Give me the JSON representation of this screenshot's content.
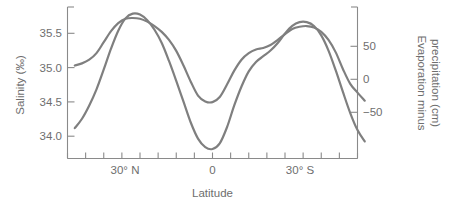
{
  "chart_data": {
    "type": "line",
    "title": "",
    "xlabel": "Latitude",
    "ylabel": "Salinity (‰)",
    "y2label": "Evaporation minus precipitation (cm)",
    "xlim": [
      40,
      -40
    ],
    "ylim": [
      33.78,
      35.85
    ],
    "y2lim": [
      -78,
      82
    ],
    "grid": false,
    "legend": "none",
    "x_tick_labels": [
      "30° N",
      "0",
      "30° S"
    ],
    "x_tick_values": [
      30,
      0,
      -30
    ],
    "x_minor_tick_values": [
      40,
      35,
      25,
      20,
      15,
      10,
      5,
      -5,
      -10,
      -15,
      -20,
      -25,
      -35,
      -40
    ],
    "y_tick_labels": [
      "35.5",
      "35.0",
      "34.5",
      "34.0"
    ],
    "y_tick_values": [
      35.5,
      35.0,
      34.5,
      34.0
    ],
    "y2_tick_labels": [
      "50",
      "0",
      "−50"
    ],
    "y2_tick_values": [
      50,
      0,
      -50
    ],
    "series": [
      {
        "name": "Salinity",
        "axis": "left",
        "units": "‰",
        "points": [
          [
            38,
            35.05
          ],
          [
            36,
            35.08
          ],
          [
            34,
            35.13
          ],
          [
            32,
            35.22
          ],
          [
            30,
            35.37
          ],
          [
            28,
            35.52
          ],
          [
            26,
            35.63
          ],
          [
            24,
            35.69
          ],
          [
            22,
            35.7
          ],
          [
            20,
            35.69
          ],
          [
            18,
            35.65
          ],
          [
            16,
            35.59
          ],
          [
            14,
            35.51
          ],
          [
            12,
            35.4
          ],
          [
            10,
            35.25
          ],
          [
            8,
            35.05
          ],
          [
            6,
            34.83
          ],
          [
            4,
            34.64
          ],
          [
            2,
            34.56
          ],
          [
            0,
            34.55
          ],
          [
            -2,
            34.62
          ],
          [
            -4,
            34.79
          ],
          [
            -6,
            34.98
          ],
          [
            -8,
            35.13
          ],
          [
            -10,
            35.22
          ],
          [
            -12,
            35.27
          ],
          [
            -14,
            35.29
          ],
          [
            -16,
            35.33
          ],
          [
            -18,
            35.4
          ],
          [
            -20,
            35.48
          ],
          [
            -22,
            35.55
          ],
          [
            -24,
            35.58
          ],
          [
            -26,
            35.59
          ],
          [
            -28,
            35.57
          ],
          [
            -30,
            35.51
          ],
          [
            -32,
            35.4
          ],
          [
            -34,
            35.23
          ],
          [
            -36,
            35.0
          ],
          [
            -38,
            34.8
          ],
          [
            -40,
            34.68
          ],
          [
            -42,
            34.57
          ]
        ]
      },
      {
        "name": "Evaporation minus precipitation",
        "axis": "right",
        "units": "cm",
        "points": [
          [
            38,
            -46
          ],
          [
            36,
            -36
          ],
          [
            34,
            -22
          ],
          [
            32,
            -5
          ],
          [
            30,
            16
          ],
          [
            28,
            38
          ],
          [
            26,
            57
          ],
          [
            24,
            70
          ],
          [
            22,
            75
          ],
          [
            20,
            74
          ],
          [
            18,
            68
          ],
          [
            16,
            58
          ],
          [
            14,
            44
          ],
          [
            12,
            25
          ],
          [
            10,
            4
          ],
          [
            8,
            -18
          ],
          [
            6,
            -40
          ],
          [
            4,
            -57
          ],
          [
            2,
            -66
          ],
          [
            0,
            -68
          ],
          [
            -2,
            -62
          ],
          [
            -4,
            -45
          ],
          [
            -6,
            -22
          ],
          [
            -8,
            -2
          ],
          [
            -10,
            14
          ],
          [
            -12,
            24
          ],
          [
            -14,
            30
          ],
          [
            -16,
            36
          ],
          [
            -18,
            44
          ],
          [
            -20,
            54
          ],
          [
            -22,
            62
          ],
          [
            -24,
            66
          ],
          [
            -26,
            66
          ],
          [
            -28,
            62
          ],
          [
            -30,
            52
          ],
          [
            -32,
            36
          ],
          [
            -34,
            15
          ],
          [
            -36,
            -8
          ],
          [
            -38,
            -30
          ],
          [
            -40,
            -48
          ],
          [
            -42,
            -60
          ]
        ]
      }
    ]
  },
  "axes": {
    "left_title": "Salinity (‰)",
    "right_title_line1": "Evaporation minus",
    "right_title_line2": "precipitation (cm)",
    "bottom_title": "Latitude"
  },
  "colors": {
    "curve": "#7f7f7f",
    "axis": "#8a8a8a",
    "text": "#6e6e6e",
    "background": "#ffffff"
  }
}
